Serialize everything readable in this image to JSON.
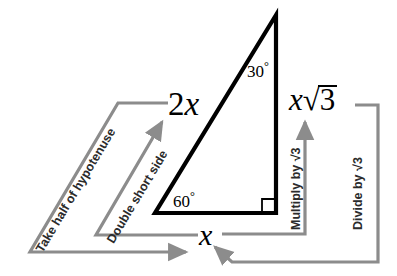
{
  "diagram": {
    "colors": {
      "triangle_stroke": "#000000",
      "flow_stroke": "#8c8c8c",
      "text": "#000000",
      "flow_text": "#2b2b2b",
      "background": "#ffffff"
    },
    "triangle": {
      "vertices": {
        "apex_top": [
          276,
          15
        ],
        "bottom_left": [
          155,
          213
        ],
        "bottom_right": [
          276,
          213
        ]
      },
      "right_angle_marker": true,
      "angles": [
        {
          "name": "angle-30",
          "value": "30",
          "degree_symbol": "°",
          "at": "apex_top"
        },
        {
          "name": "angle-60",
          "value": "60",
          "degree_symbol": "°",
          "at": "bottom_left"
        }
      ]
    },
    "side_labels": {
      "hypotenuse": {
        "coefficient": "2",
        "variable": "x"
      },
      "short_leg": {
        "variable": "x"
      },
      "long_leg": {
        "variable": "x",
        "radical": "3",
        "radical_symbol": "√"
      }
    },
    "flows": [
      {
        "name": "take-half-of-hypotenuse",
        "label": "Take half of hypotenuse",
        "from": "2x",
        "to": "x",
        "direction": "hypotenuse-to-short-leg",
        "rotation_deg": -59
      },
      {
        "name": "double-short-side",
        "label": "Double short side",
        "from": "x",
        "to": "2x",
        "direction": "short-leg-to-hypotenuse",
        "rotation_deg": -59
      },
      {
        "name": "multiply-by-sqrt3",
        "label": "Multiply by √3",
        "from": "x",
        "to": "x√3",
        "direction": "short-leg-to-long-leg",
        "rotation_deg": -90
      },
      {
        "name": "divide-by-sqrt3",
        "label": "Divide by √3",
        "from": "x√3",
        "to": "x",
        "direction": "long-leg-to-short-leg",
        "rotation_deg": -90
      }
    ]
  }
}
